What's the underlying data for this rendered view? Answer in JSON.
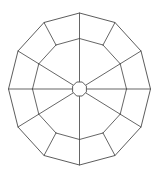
{
  "figure": {
    "background_color": "#ffffff",
    "line_color": "#4a4a4a",
    "line_width": 0.85,
    "canvas": {
      "width": 160,
      "height": 174
    }
  },
  "chart_data": {
    "type": "diagram",
    "xlabel": "",
    "ylabel": "",
    "center": {
      "x": 79.5,
      "y": 89.0
    },
    "hub": {
      "name": "central-hub-polygon",
      "sides": 8,
      "radius": 7.5,
      "rotation_deg": 22.5,
      "points": [
        [
          86.4,
          86.1
        ],
        [
          86.4,
          91.9
        ],
        [
          82.3,
          96.0
        ],
        [
          76.7,
          96.0
        ],
        [
          72.6,
          91.9
        ],
        [
          72.6,
          86.1
        ],
        [
          76.7,
          82.0
        ],
        [
          82.3,
          82.0
        ]
      ]
    },
    "outer_ring": {
      "name": "outer-dodecagon",
      "sides": 12,
      "radius_x": 71.0,
      "radius_y": 76.0,
      "rotation_deg": -90,
      "points": [
        [
          79.5,
          13.0
        ],
        [
          115.0,
          22.5
        ],
        [
          141.0,
          51.0
        ],
        [
          150.5,
          89.0
        ],
        [
          141.0,
          127.0
        ],
        [
          115.0,
          155.5
        ],
        [
          79.5,
          165.0
        ],
        [
          44.0,
          155.5
        ],
        [
          18.0,
          127.0
        ],
        [
          8.5,
          89.0
        ],
        [
          18.0,
          51.0
        ],
        [
          44.0,
          22.5
        ]
      ]
    },
    "mid_ring": {
      "name": "intermediate-ring",
      "sides": 12,
      "radius_x": 47.0,
      "radius_y": 50.5,
      "rotation_deg": -90,
      "points": [
        [
          79.5,
          38.5
        ],
        [
          103.0,
          45.0
        ],
        [
          120.2,
          63.8
        ],
        [
          126.5,
          89.0
        ],
        [
          120.2,
          114.2
        ],
        [
          103.0,
          133.0
        ],
        [
          79.5,
          139.5
        ],
        [
          56.0,
          133.0
        ],
        [
          38.8,
          114.2
        ],
        [
          32.5,
          89.0
        ],
        [
          38.8,
          63.8
        ],
        [
          56.0,
          45.0
        ]
      ]
    },
    "spokes": {
      "name": "radial-spokes",
      "count": 8,
      "from": "hub",
      "to": "outer_ring_region",
      "angles_deg": [
        -90,
        -45,
        0,
        45,
        90,
        135,
        180,
        225
      ]
    },
    "struts": {
      "name": "connecting-struts",
      "count": 12,
      "description": "Each mid-ring vertex joins its matching outer-ring vertex"
    },
    "counts": {
      "outer_vertices": 12,
      "mid_vertices": 12,
      "hub_vertices": 8,
      "spoke_lines": 8,
      "panels": 12
    }
  }
}
